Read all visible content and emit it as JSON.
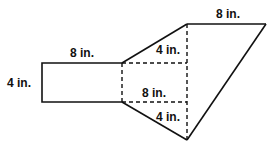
{
  "diagram": {
    "stroke_color": "#111111",
    "background": "#ffffff",
    "labels": {
      "rect_top_length": "8 in.",
      "rect_left_height": "4 in.",
      "kite_top_length": "8 in.",
      "upper_triangle_height": "4 in.",
      "middle_rect_length": "8 in.",
      "lower_triangle_height": "4 in."
    }
  }
}
